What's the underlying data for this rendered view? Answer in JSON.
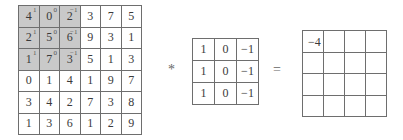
{
  "input": {
    "rows": [
      [
        "4",
        "0",
        "2",
        "3",
        "7",
        "5"
      ],
      [
        "2",
        "5",
        "6",
        "9",
        "3",
        "1"
      ],
      [
        "1",
        "7",
        "3",
        "5",
        "1",
        "3"
      ],
      [
        "0",
        "1",
        "4",
        "1",
        "9",
        "7"
      ],
      [
        "3",
        "4",
        "2",
        "7",
        "3",
        "8"
      ],
      [
        "1",
        "3",
        "6",
        "1",
        "2",
        "9"
      ]
    ],
    "highlight_weights": [
      [
        "1",
        "0",
        "−1"
      ],
      [
        "1",
        "0",
        "−1"
      ],
      [
        "1",
        "0",
        "−1"
      ]
    ],
    "highlight_color": "#c9c9c9"
  },
  "operators": {
    "convolution": "*",
    "equals": "="
  },
  "kernel": {
    "rows": [
      [
        "1",
        "0",
        "−1"
      ],
      [
        "1",
        "0",
        "−1"
      ],
      [
        "1",
        "0",
        "−1"
      ]
    ]
  },
  "output": {
    "rows": [
      [
        "−4",
        "",
        "",
        ""
      ],
      [
        "",
        "",
        "",
        ""
      ],
      [
        "",
        "",
        "",
        ""
      ],
      [
        "",
        "",
        "",
        ""
      ]
    ]
  }
}
